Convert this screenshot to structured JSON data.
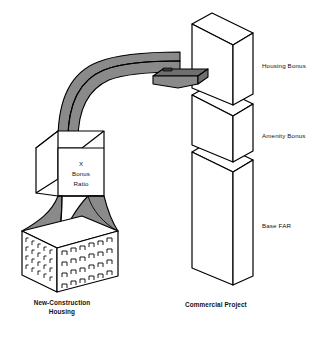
{
  "figure": {
    "title_fragment_left": "·",
    "title_fragment_right": "·",
    "background_color": "#ffffff",
    "line_color": "#000000",
    "fill_white": "#ffffff",
    "fill_gray": "#8a8a8a",
    "fill_gray_dark": "#6f6f6f",
    "fill_gray_light": "#9a9a9a"
  },
  "left_group": {
    "caption_line1": "New-Construction",
    "caption_line2": "Housing",
    "cube": {
      "line1": "X",
      "line2": "Bonus",
      "line3": "Ratio"
    },
    "funnel_name": "bonus-funnel",
    "building_name": "new-construction-housing-building"
  },
  "right_group": {
    "caption": "Commercial Project",
    "tiers": [
      {
        "id": "housing-bonus",
        "label": "Housing Bonus"
      },
      {
        "id": "amenity-bonus",
        "label": "Amenity Bonus"
      },
      {
        "id": "base-far",
        "label": "Base FAR"
      }
    ]
  },
  "connector": {
    "name": "bonus-transfer-arrow",
    "direction": "left-to-right",
    "description": "curved 3D ribbon arrow"
  }
}
